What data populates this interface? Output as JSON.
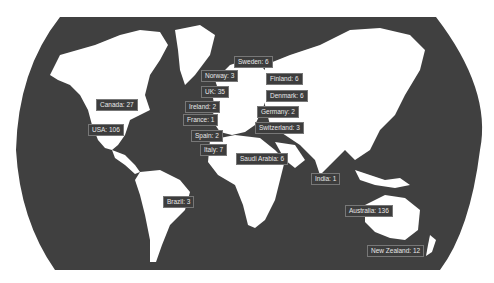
{
  "map": {
    "title": "",
    "ocean_color": "#404040",
    "land_color": "#ffffff",
    "labels": [
      {
        "country": "Sweden",
        "count": 6,
        "text": "Sweden: 6",
        "x": 234,
        "y": 56
      },
      {
        "country": "Norway",
        "count": 3,
        "text": "Norway: 3",
        "x": 201,
        "y": 70
      },
      {
        "country": "Finland",
        "count": 6,
        "text": "Finland: 6",
        "x": 266,
        "y": 73
      },
      {
        "country": "UK",
        "count": 35,
        "text": "UK: 35",
        "x": 201,
        "y": 86
      },
      {
        "country": "Denmark",
        "count": 6,
        "text": "Denmark: 6",
        "x": 266,
        "y": 90
      },
      {
        "country": "Canada",
        "count": 27,
        "text": "Canada: 27",
        "x": 96,
        "y": 99
      },
      {
        "country": "Ireland",
        "count": 2,
        "text": "Ireland: 2",
        "x": 185,
        "y": 101
      },
      {
        "country": "Germany",
        "count": 2,
        "text": "Germany: 2",
        "x": 257,
        "y": 106
      },
      {
        "country": "France",
        "count": 1,
        "text": "France: 1",
        "x": 183,
        "y": 114
      },
      {
        "country": "Switzerland",
        "count": 3,
        "text": "Switzerland: 3",
        "x": 255,
        "y": 122
      },
      {
        "country": "USA",
        "count": 106,
        "text": "USA: 106",
        "x": 88,
        "y": 124
      },
      {
        "country": "Spain",
        "count": 2,
        "text": "Spain: 2",
        "x": 191,
        "y": 130
      },
      {
        "country": "Italy",
        "count": 7,
        "text": "Italy: 7",
        "x": 200,
        "y": 144
      },
      {
        "country": "Saudi Arabia",
        "count": 6,
        "text": "Saudi Arabia: 6",
        "x": 236,
        "y": 153
      },
      {
        "country": "India",
        "count": 1,
        "text": "India: 1",
        "x": 311,
        "y": 173
      },
      {
        "country": "Brazil",
        "count": 3,
        "text": "Brazil: 3",
        "x": 163,
        "y": 196
      },
      {
        "country": "Australia",
        "count": 136,
        "text": "Australia: 136",
        "x": 345,
        "y": 205
      },
      {
        "country": "New Zealand",
        "count": 12,
        "text": "New Zealand: 12",
        "x": 367,
        "y": 245
      }
    ]
  }
}
